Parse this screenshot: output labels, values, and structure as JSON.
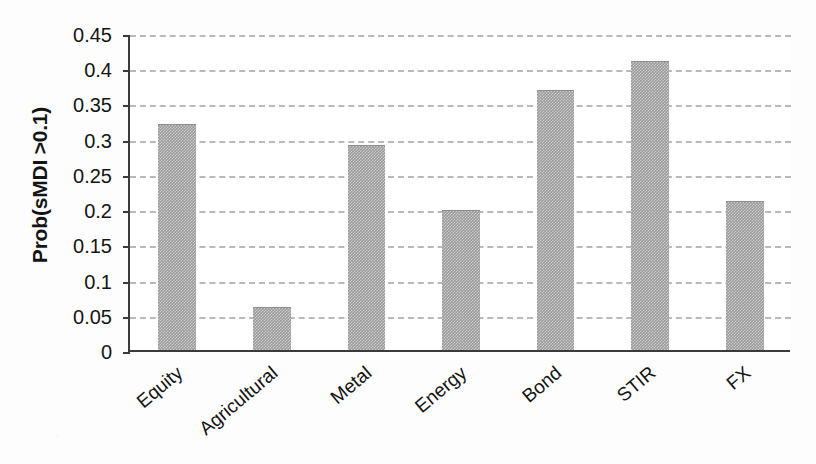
{
  "chart_data": {
    "type": "bar",
    "title": "",
    "subtitle": "",
    "xlabel": "",
    "ylabel": "Prob(sMDI >0.1)",
    "categories": [
      "Equity",
      "Agricultural",
      "Metal",
      "Energy",
      "Bond",
      "STIR",
      "FX"
    ],
    "values": [
      0.32,
      0.06,
      0.29,
      0.198,
      0.368,
      0.409,
      0.21
    ],
    "ylim": [
      0,
      0.45
    ],
    "yticks": [
      0,
      0.05,
      0.1,
      0.15,
      0.2,
      0.25,
      0.3,
      0.35,
      0.4,
      0.45
    ],
    "ytick_labels": [
      "0",
      "0.05",
      "0.1",
      "0.15",
      "0.2",
      "0.25",
      "0.3",
      "0.35",
      "0.4",
      "0.45"
    ],
    "grid": true,
    "grid_axis": "y",
    "grid_style": "dashed",
    "legend": false,
    "legend_position": "none",
    "bar_color": "#9b9b9b",
    "axis_color": "#3a3a3a",
    "grid_color": "#b9b9b9",
    "background_color": "#fdfdfd",
    "xtick_label_rotation": -40,
    "series": [
      {
        "name": "Prob(sMDI >0.1)",
        "values": [
          0.32,
          0.06,
          0.29,
          0.198,
          0.368,
          0.409,
          0.21
        ]
      }
    ]
  }
}
